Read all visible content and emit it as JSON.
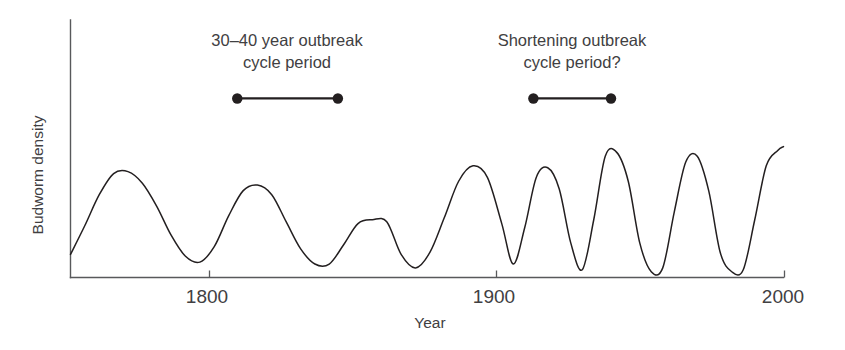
{
  "chart_data": {
    "type": "line",
    "title": "",
    "xlabel": "Year",
    "ylabel": "Budworm density",
    "xlim": [
      1752,
      2000
    ],
    "ylim": [
      0,
      1
    ],
    "grid": false,
    "legend": null,
    "xticks": [
      1800,
      1900,
      2000
    ],
    "xtick_labels": [
      "1800",
      "1900",
      "2000"
    ],
    "yticks": [],
    "ytick_labels": [],
    "series": [
      {
        "name": "Budworm density",
        "description": "Spruce budworm outbreak cycles; broad ~35-year cycles early, narrowing and sharpening toward 2000",
        "x": [
          1752,
          1757,
          1762,
          1767,
          1772,
          1777,
          1782,
          1787,
          1792,
          1797,
          1802,
          1807,
          1812,
          1817,
          1822,
          1827,
          1832,
          1837,
          1842,
          1847,
          1852,
          1857,
          1862,
          1867,
          1872,
          1877,
          1882,
          1887,
          1892,
          1897,
          1902,
          1906,
          1910,
          1914,
          1918,
          1922,
          1926,
          1930,
          1934,
          1938,
          1942,
          1946,
          1950,
          1954,
          1958,
          1962,
          1966,
          1970,
          1974,
          1978,
          1982,
          1986,
          1990,
          1994,
          1998,
          2000
        ],
        "y": [
          0.12,
          0.27,
          0.43,
          0.54,
          0.55,
          0.49,
          0.37,
          0.22,
          0.11,
          0.08,
          0.16,
          0.32,
          0.45,
          0.48,
          0.43,
          0.29,
          0.15,
          0.07,
          0.07,
          0.17,
          0.28,
          0.3,
          0.29,
          0.12,
          0.05,
          0.13,
          0.31,
          0.5,
          0.58,
          0.52,
          0.28,
          0.07,
          0.26,
          0.52,
          0.57,
          0.46,
          0.18,
          0.04,
          0.3,
          0.63,
          0.65,
          0.5,
          0.18,
          0.03,
          0.05,
          0.34,
          0.6,
          0.63,
          0.45,
          0.13,
          0.03,
          0.04,
          0.3,
          0.58,
          0.66,
          0.68
        ]
      }
    ],
    "annotations": [
      {
        "id": "left-cycle-annotation",
        "text_line1": "30–40 year outbreak",
        "text_line2": "cycle period",
        "bar_x_start": 1810,
        "bar_x_end": 1845,
        "bar_y": 0.93
      },
      {
        "id": "right-cycle-annotation",
        "text_line1": "Shortening outbreak",
        "text_line2": "cycle period?",
        "bar_x_start": 1913,
        "bar_x_end": 1940,
        "bar_y": 0.93
      }
    ]
  },
  "axes": {
    "y_axis_title": "Budworm density",
    "x_axis_title": "Year",
    "x_tick_1": "1800",
    "x_tick_2": "1900",
    "x_tick_3": "2000"
  },
  "annotations": {
    "left": {
      "line1": "30–40 year outbreak",
      "line2": "cycle period"
    },
    "right": {
      "line1": "Shortening outbreak",
      "line2": "cycle period?"
    }
  },
  "colors": {
    "curve": "#231f20",
    "axis": "#58595b",
    "text": "#414042",
    "background": "#ffffff"
  }
}
